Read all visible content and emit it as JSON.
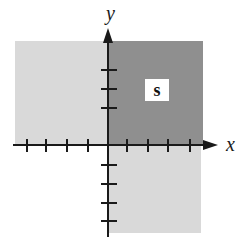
{
  "diagram": {
    "type": "coordinate-plane-regions",
    "axes": {
      "x_label": "x",
      "y_label": "y",
      "x_ticks_negative": 4,
      "x_ticks_positive": 4,
      "y_ticks_positive": 3,
      "y_ticks_negative": 4
    },
    "regions": [
      {
        "name": "quadrant-1",
        "label": "s",
        "shade": "dark",
        "color": "#8f8f8f"
      },
      {
        "name": "quadrant-2",
        "label": "",
        "shade": "light",
        "color": "#d9d9d9"
      },
      {
        "name": "quadrant-4",
        "label": "",
        "shade": "light",
        "color": "#d9d9d9"
      }
    ],
    "region_label": "s",
    "colors": {
      "axis": "#1a1a1a",
      "dark_region": "#8f8f8f",
      "light_region": "#d9d9d9",
      "label_box": "#ffffff"
    }
  }
}
